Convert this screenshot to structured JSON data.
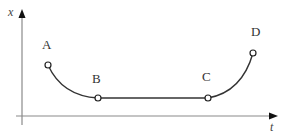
{
  "diagram": {
    "type": "position-time graph",
    "axes": {
      "y_label": "x",
      "x_label": "t",
      "color": "#888888"
    },
    "curve_color": "#333333",
    "points": [
      {
        "label": "A",
        "x": 48,
        "y": 65,
        "label_x": 42,
        "label_y": 49
      },
      {
        "label": "B",
        "x": 98,
        "y": 98,
        "label_x": 92,
        "label_y": 83
      },
      {
        "label": "C",
        "x": 208,
        "y": 98,
        "label_x": 202,
        "label_y": 81
      },
      {
        "label": "D",
        "x": 253,
        "y": 53,
        "label_x": 251,
        "label_y": 36
      }
    ],
    "segments": [
      {
        "from": "A",
        "to": "B",
        "shape": "curve (concave up, decreasing)"
      },
      {
        "from": "B",
        "to": "C",
        "shape": "horizontal line"
      },
      {
        "from": "C",
        "to": "D",
        "shape": "curve (concave up, increasing)"
      }
    ]
  }
}
